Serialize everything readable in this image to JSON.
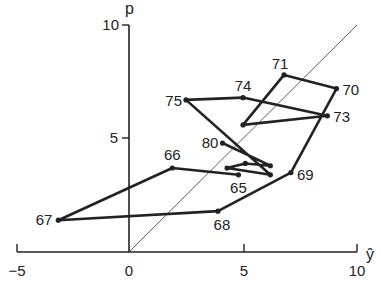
{
  "chart_data": {
    "type": "line",
    "title": "",
    "xlabel": "ŷ",
    "ylabel": "p",
    "xlim": [
      -5,
      10
    ],
    "ylim": [
      0,
      10
    ],
    "x_ticks": [
      "−5",
      "0",
      "5",
      "10"
    ],
    "y_ticks": [
      "5",
      "10"
    ],
    "grid": false,
    "reference_line": {
      "type": "45-degree",
      "from": [
        0,
        0
      ],
      "to": [
        10,
        10
      ]
    },
    "series": [
      {
        "name": "path",
        "points": [
          {
            "label": "65",
            "x": 4.8,
            "y": 3.4
          },
          {
            "label": "66",
            "x": 1.9,
            "y": 3.7
          },
          {
            "label": "67",
            "x": -3.1,
            "y": 1.4
          },
          {
            "label": "68",
            "x": 3.9,
            "y": 1.8
          },
          {
            "label": "69",
            "x": 7.1,
            "y": 3.5
          },
          {
            "label": "70",
            "x": 9.1,
            "y": 7.2
          },
          {
            "label": "71",
            "x": 6.8,
            "y": 7.8
          },
          {
            "label": "",
            "x": 5.0,
            "y": 5.6
          },
          {
            "label": "73",
            "x": 8.7,
            "y": 6.0
          },
          {
            "label": "74",
            "x": 5.0,
            "y": 6.8
          },
          {
            "label": "75",
            "x": 2.5,
            "y": 6.7
          },
          {
            "label": "",
            "x": 6.2,
            "y": 3.4
          },
          {
            "label": "",
            "x": 4.3,
            "y": 3.7
          },
          {
            "label": "",
            "x": 5.1,
            "y": 3.9
          },
          {
            "label": "",
            "x": 6.2,
            "y": 3.8
          },
          {
            "label": "80",
            "x": 4.1,
            "y": 4.8
          }
        ]
      }
    ]
  },
  "labels": {
    "y_axis": "p",
    "x_axis": "ŷ",
    "x_tick_m5": "−5",
    "x_tick_0": "0",
    "x_tick_5": "5",
    "x_tick_10": "10",
    "y_tick_5": "5",
    "y_tick_10": "10"
  }
}
